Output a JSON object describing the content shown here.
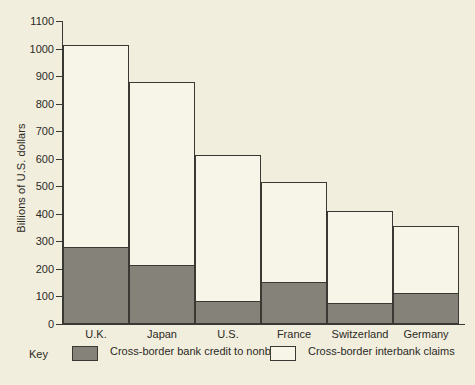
{
  "chart_data": {
    "type": "bar",
    "stacked": true,
    "title": "",
    "xlabel": "",
    "ylabel": "Billions of U.S. dollars",
    "ylim": [
      0,
      1100
    ],
    "ytick_labels": [
      "1100",
      "1000",
      "900",
      "800",
      "700",
      "600",
      "500",
      "400",
      "300",
      "200",
      "100",
      "0"
    ],
    "ytick_values": [
      1100,
      1000,
      900,
      800,
      700,
      600,
      500,
      400,
      300,
      200,
      100,
      0
    ],
    "grid": false,
    "legend_position": "below-axis",
    "categories": [
      "U.K.",
      "Japan",
      "U.S.",
      "France",
      "Switzerland",
      "Germany"
    ],
    "series": [
      {
        "name": "Cross-border bank credit to nonbanks",
        "color": "#85827a",
        "values": [
          280,
          214,
          84,
          152,
          76,
          113
        ]
      },
      {
        "name": "Cross-border interbank claims",
        "color": "#f7f4e8",
        "values": [
          733,
          664,
          529,
          363,
          334,
          243
        ]
      }
    ],
    "totals": [
      1013,
      878,
      613,
      515,
      410,
      356
    ]
  },
  "legend": {
    "key_word": "Key",
    "entries": [
      {
        "label": "Cross-border bank credit\nto nonbanks",
        "swatch": "gray-swatch"
      },
      {
        "label": "Cross-border interbank claims",
        "swatch": "white-swatch"
      }
    ]
  },
  "colors": {
    "page_background": "#f2eedd",
    "plot_background": "#f2eedd",
    "bar_gray": "#85827a",
    "bar_white": "#f7f4e8",
    "ink": "#3a3833"
  }
}
